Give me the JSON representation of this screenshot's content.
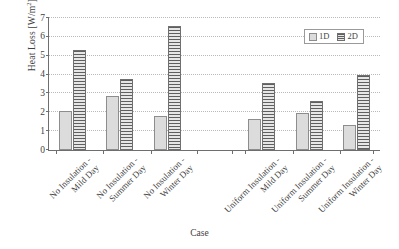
{
  "chart_data": {
    "type": "bar",
    "title": "",
    "xlabel": "Case",
    "ylabel": "Heat Loss [W/m2]",
    "ylabel_base": "Heat Loss [W/m",
    "ylabel_sup": "2",
    "ylabel_tail": "]",
    "ylim": [
      0,
      7
    ],
    "ytick_labels": [
      "0",
      "1",
      "2",
      "3",
      "4",
      "5",
      "6",
      "7"
    ],
    "ytick_values": [
      0,
      1,
      2,
      3,
      4,
      5,
      6,
      7
    ],
    "grid": true,
    "grid_axis": "y",
    "legend_position": "top-right",
    "categories": [
      "No Insulation - Mild Day",
      "No Insulation - Summer Day",
      "No Insulation - Winter Day",
      "Uniform Insulation - Mild Day",
      "Uniform Insulation - Summer Day",
      "Uniform Insulation - Winter Day"
    ],
    "category_lines": [
      [
        "No Insulation -",
        "Mild Day"
      ],
      [
        "No Insulation -",
        "Summer Day"
      ],
      [
        "No Insulation -",
        "Winter Day"
      ],
      [
        "Uniform Insulation -",
        "Mild Day"
      ],
      [
        "Uniform Insulation -",
        "Summer Day"
      ],
      [
        "Uniform Insulation -",
        "Winter Day"
      ]
    ],
    "series": [
      {
        "name": "1D",
        "values": [
          2.08,
          2.85,
          1.82,
          1.65,
          1.98,
          1.33
        ],
        "color": "#dcdcdc",
        "edge_color": "#8d8d8d",
        "pattern": "dots"
      },
      {
        "name": "2D",
        "values": [
          5.32,
          3.78,
          6.58,
          3.53,
          2.62,
          4.0
        ],
        "color": "#c4c4c4",
        "edge_color": "#6f6f6f",
        "pattern": "horizontal-lines"
      }
    ],
    "group_gap_after_index": 2
  },
  "legend": {
    "entries": [
      {
        "label": "1D",
        "swatch": "legend-swatch-1d"
      },
      {
        "label": "2D",
        "swatch": "legend-swatch-2d"
      }
    ]
  },
  "axes": {
    "x_title": "Case",
    "axis_color": "#6e6e6e",
    "grid_color": "#b9b9b9"
  }
}
